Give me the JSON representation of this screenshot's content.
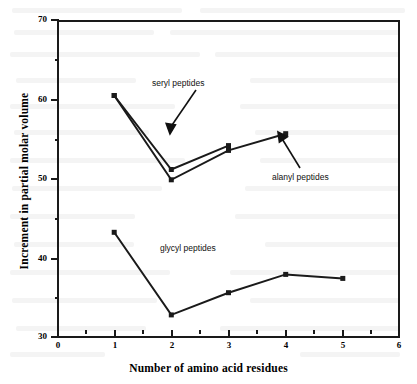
{
  "chart_data": {
    "type": "line",
    "title": "",
    "xlabel": "Number of amino acid residues",
    "ylabel": "Increment in partial molar volume",
    "xlim": [
      0,
      6
    ],
    "ylim": [
      30,
      70
    ],
    "xticks": [
      0,
      1,
      2,
      3,
      4,
      5,
      6
    ],
    "yticks": [
      30,
      40,
      50,
      60,
      70
    ],
    "x_minor_ticks": [
      0.5,
      1.5,
      2.5,
      3.5,
      4.5,
      5.5
    ],
    "y_minor_ticks": [
      35,
      45,
      55,
      65
    ],
    "grid": false,
    "legend": "annotations-with-arrows",
    "marker": "filled-square",
    "series": [
      {
        "name": "seryl peptides",
        "x": [
          1,
          2,
          3
        ],
        "values": [
          60.5,
          51.2,
          54.2
        ]
      },
      {
        "name": "alanyl peptides",
        "x": [
          1,
          2,
          3,
          4
        ],
        "values": [
          60.5,
          49.9,
          53.6,
          55.7
        ]
      },
      {
        "name": "glycyl peptides",
        "x": [
          1,
          2,
          3,
          4,
          5
        ],
        "values": [
          43.3,
          32.9,
          35.7,
          38.0,
          37.5
        ]
      }
    ],
    "annotations": [
      {
        "label": "seryl peptides",
        "points_to": "seryl series near x=2"
      },
      {
        "label": "alanyl peptides",
        "points_to": "alanyl series near x=4"
      },
      {
        "label": "glycyl peptides",
        "points_to": "glycyl series (no arrow)"
      }
    ]
  },
  "axes": {
    "x_tick_labels": [
      "0",
      "1",
      "2",
      "3",
      "4",
      "5",
      "6"
    ],
    "y_tick_labels": [
      "70",
      "60",
      "50",
      "40",
      "30"
    ],
    "x_title": "Number of amino acid residues",
    "y_title": "Increment in partial molar volume"
  },
  "colors": {
    "ink": "#1a1a1a",
    "background": "#ffffff"
  }
}
